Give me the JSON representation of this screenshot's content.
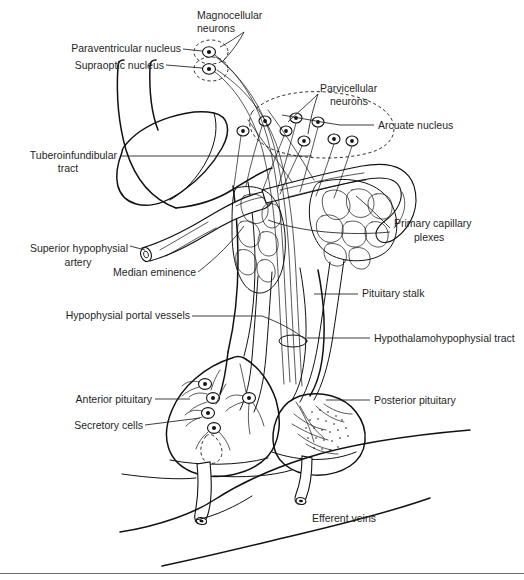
{
  "figure": {
    "background_color": "#ffffff",
    "ink_color": "#1b1b1b",
    "width": 524,
    "height": 580
  },
  "labels": {
    "magnocellular_neurons_line1": "Magnocellular",
    "magnocellular_neurons_line2": "neurons",
    "paraventricular_nucleus": "Paraventricular nucleus",
    "supraoptic_nucleus": "Supraoptic nucleus",
    "parvicellular_neurons_line1": "Parvicellular",
    "parvicellular_neurons_line2": "neurons",
    "arcuate_nucleus": "Arcuate nucleus",
    "tuberoinfundibular_tract_line1": "Tuberoinfundibular",
    "tuberoinfundibular_tract_line2": "tract",
    "primary_capillary_plexes_line1": "Primary capillary",
    "primary_capillary_plexes_line2": "plexes",
    "superior_hypophysial_artery_line1": "Superior hypophysial",
    "superior_hypophysial_artery_line2": "artery",
    "median_eminence": "Median eminence",
    "pituitary_stalk": "Pituitary stalk",
    "hypophysial_portal_vessels": "Hypophysial portal vessels",
    "hypothalamohypophysial_tract": "Hypothalamohypophysial tract",
    "anterior_pituitary": "Anterior pituitary",
    "posterior_pituitary": "Posterior pituitary",
    "secretory_cells": "Secretory cells",
    "efferent_veins": "Efferent veins"
  }
}
